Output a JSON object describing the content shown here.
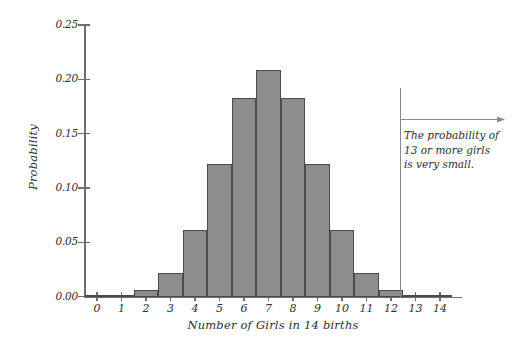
{
  "chart_data": {
    "type": "bar",
    "title": "",
    "xlabel": "Number of Girls in 14 births",
    "ylabel": "Probability",
    "categories": [
      "0",
      "1",
      "2",
      "3",
      "4",
      "5",
      "6",
      "7",
      "8",
      "9",
      "10",
      "11",
      "12",
      "13",
      "14"
    ],
    "values": [
      0.0,
      0.001,
      0.006,
      0.022,
      0.061,
      0.122,
      0.183,
      0.209,
      0.183,
      0.122,
      0.061,
      0.022,
      0.006,
      0.001,
      0.0
    ],
    "xlim": [
      -0.5,
      14.5
    ],
    "ylim": [
      0.0,
      0.25
    ],
    "ytick_labels": [
      "0.00",
      "0.05",
      "0.10",
      "0.15",
      "0.20",
      "0.25"
    ],
    "ytick_values": [
      0.0,
      0.05,
      0.1,
      0.15,
      0.2,
      0.25
    ],
    "xtick_labels": [
      "0",
      "1",
      "2",
      "3",
      "4",
      "5",
      "6",
      "7",
      "8",
      "9",
      "10",
      "11",
      "12",
      "13",
      "14"
    ],
    "grid": false,
    "legend": null,
    "bar_fill_color": "#8d8d8d",
    "bar_edge_color": "#4a4a4a",
    "axis_color": "#6e6e6e",
    "text_color": "#2f2f2f",
    "background_color": "#ffffff",
    "annotations": [
      {
        "name": "thirteen-or-more-note",
        "lines": [
          "The probability of",
          "13 or more girls",
          "is very small."
        ],
        "marker_x_value": 12.5,
        "marker_type": "vertical-line-with-right-arrow",
        "marker_color": "#8a8a8a"
      }
    ]
  }
}
